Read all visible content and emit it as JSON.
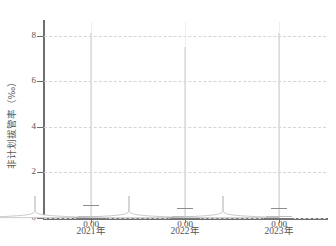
{
  "chart_data": {
    "type": "violin",
    "title": "",
    "xlabel": "",
    "ylabel": "非计划拔管率（‰）",
    "ylim": [
      0,
      8.6
    ],
    "grid": true,
    "legend": "none",
    "categories": [
      "2021年",
      "2022年",
      "2023年"
    ],
    "y_ticks": [
      {
        "value": 0,
        "label": "0"
      },
      {
        "value": 2,
        "label": "2"
      },
      {
        "value": 4,
        "label": "4"
      },
      {
        "value": 6,
        "label": "6"
      },
      {
        "value": 8,
        "label": "8"
      }
    ],
    "series": [
      {
        "name": "2021年",
        "median": 0.0,
        "median_label": "0.00",
        "q1": 0.0,
        "q3": 0.1,
        "whisker_low": 0.0,
        "whisker_high": 0.55,
        "tail_max": 8.1,
        "density_peak_value": 0.0
      },
      {
        "name": "2022年",
        "median": 0.0,
        "median_label": "0.00",
        "q1": 0.0,
        "q3": 0.1,
        "whisker_low": 0.0,
        "whisker_high": 0.45,
        "tail_max": 7.5,
        "density_peak_value": 0.0
      },
      {
        "name": "2023年",
        "median": 0.0,
        "median_label": "0.00",
        "q1": 0.0,
        "q3": 0.1,
        "whisker_low": 0.0,
        "whisker_high": 0.45,
        "tail_max": 8.1,
        "density_peak_value": 0.0
      }
    ],
    "value_labels": [
      "0.00",
      "0.00",
      "0.00"
    ]
  },
  "colors": {
    "axis": "#6e6e6e",
    "gridline": "#d9d2d8",
    "violin_outline": "#b4b4b4",
    "violin_fill": "#ffffff",
    "tail": "#c9c9c9",
    "text": "#555555",
    "background": "#ffffff"
  }
}
